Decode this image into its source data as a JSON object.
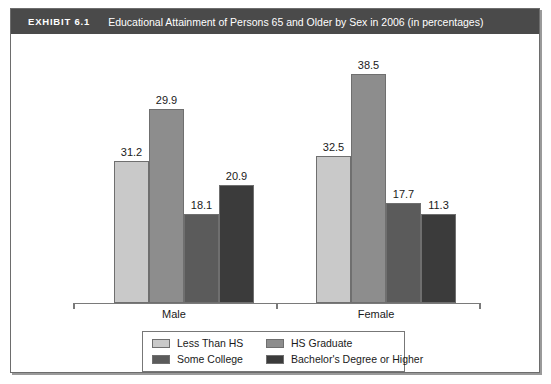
{
  "exhibit": {
    "label": "EXHIBIT 6.1",
    "title": "Educational Attainment of Persons 65 and Older by Sex in 2006 (in percentages)"
  },
  "chart_data": {
    "type": "bar",
    "title": "Educational Attainment of Persons 65 and Older by Sex in 2006 (in percentages)",
    "xlabel": "",
    "ylabel": "",
    "grid": false,
    "legend_position": "bottom",
    "axis_visible": {
      "x": true,
      "y": false
    },
    "categories": [
      "Male",
      "Female"
    ],
    "series": [
      {
        "name": "Less Than HS",
        "color": "#c9c9c9",
        "values": [
          31.2,
          32.5
        ]
      },
      {
        "name": "HS Graduate",
        "color": "#8d8d8d",
        "values": [
          29.9,
          38.5
        ]
      },
      {
        "name": "Some College",
        "color": "#5b5b5b",
        "values": [
          18.1,
          17.7
        ]
      },
      {
        "name": "Bachelor's Degree or Higher",
        "color": "#3b3b3b",
        "values": [
          20.9,
          11.3
        ]
      }
    ],
    "value_labels": {
      "Male": [
        "31.2",
        "29.9",
        "18.1",
        "20.9"
      ],
      "Female": [
        "32.5",
        "38.5",
        "17.7",
        "11.3"
      ]
    },
    "bar_pixel_heights": {
      "Male": [
        142,
        194,
        89,
        118
      ],
      "Female": [
        147,
        229,
        100,
        89
      ]
    }
  },
  "legend": {
    "entries": [
      {
        "label": "Less Than HS",
        "color": "#c9c9c9"
      },
      {
        "label": "HS Graduate",
        "color": "#8d8d8d"
      },
      {
        "label": "Some College",
        "color": "#5b5b5b"
      },
      {
        "label": "Bachelor's Degree or Higher",
        "color": "#3b3b3b"
      }
    ]
  }
}
